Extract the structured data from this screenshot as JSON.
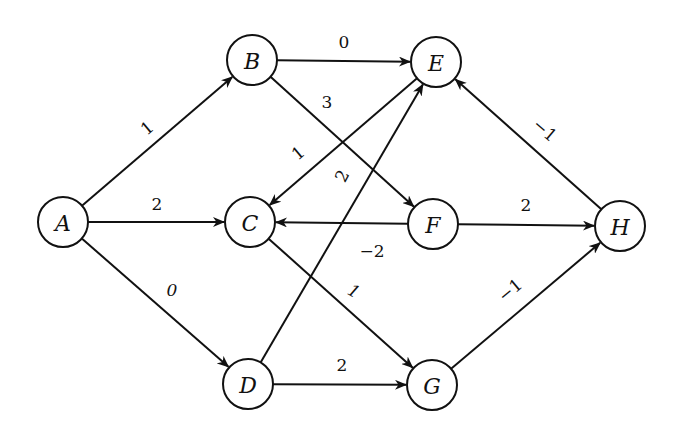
{
  "diagram": {
    "type": "directed-weighted-graph",
    "colors": {
      "stroke": "#111111",
      "node_fill": "#ffffff",
      "background": "#ffffff"
    },
    "node_radius": 25,
    "nodes": [
      {
        "id": "A",
        "label": "A",
        "x": 63,
        "y": 222
      },
      {
        "id": "B",
        "label": "B",
        "x": 252,
        "y": 60
      },
      {
        "id": "C",
        "label": "C",
        "x": 250,
        "y": 222
      },
      {
        "id": "D",
        "label": "D",
        "x": 248,
        "y": 384
      },
      {
        "id": "E",
        "label": "E",
        "x": 436,
        "y": 62
      },
      {
        "id": "F",
        "label": "F",
        "x": 433,
        "y": 224
      },
      {
        "id": "G",
        "label": "G",
        "x": 432,
        "y": 385
      },
      {
        "id": "H",
        "label": "H",
        "x": 620,
        "y": 226
      }
    ],
    "edges": [
      {
        "from": "A",
        "to": "B",
        "weight": "1",
        "lx": 147,
        "ly": 128,
        "rot": -40
      },
      {
        "from": "A",
        "to": "C",
        "weight": "2",
        "lx": 157,
        "ly": 204,
        "rot": 0
      },
      {
        "from": "A",
        "to": "D",
        "weight": "0",
        "lx": 172,
        "ly": 290,
        "rot": 0,
        "italic": true
      },
      {
        "from": "B",
        "to": "E",
        "weight": "0",
        "lx": 344,
        "ly": 42,
        "rot": 0
      },
      {
        "from": "B",
        "to": "F",
        "weight": "3",
        "lx": 327,
        "ly": 102,
        "rot": 0
      },
      {
        "from": "E",
        "to": "C",
        "weight": "1",
        "lx": 298,
        "ly": 153,
        "rot": -40
      },
      {
        "from": "D",
        "to": "E",
        "weight": "2",
        "lx": 342,
        "ly": 176,
        "rot": -62
      },
      {
        "from": "F",
        "to": "C",
        "weight": "−2",
        "lx": 372,
        "ly": 251,
        "rot": 0
      },
      {
        "from": "F",
        "to": "H",
        "weight": "2",
        "lx": 526,
        "ly": 205,
        "rot": 0
      },
      {
        "from": "C",
        "to": "G",
        "weight": "1",
        "lx": 354,
        "ly": 291,
        "rot": 30,
        "italic": true
      },
      {
        "from": "D",
        "to": "G",
        "weight": "2",
        "lx": 342,
        "ly": 365,
        "rot": 0
      },
      {
        "from": "H",
        "to": "E",
        "weight": "−1",
        "lx": 545,
        "ly": 130,
        "rot": 40
      },
      {
        "from": "G",
        "to": "H",
        "weight": "−1",
        "lx": 510,
        "ly": 290,
        "rot": -40
      }
    ]
  }
}
